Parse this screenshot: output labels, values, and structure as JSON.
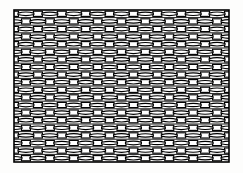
{
  "figure": {
    "title": "Woven wire mesh pattern",
    "caption": "",
    "background_color": "#fdfdfc",
    "ink_color": "#000000",
    "fill_color": "#ffffff",
    "frame": {
      "x": 14,
      "y": 10,
      "width": 215,
      "height": 152,
      "stroke_color": "#000000",
      "stroke_width": 1.6
    },
    "pattern": {
      "type": "woven-mesh",
      "rows": 20,
      "columns": 9,
      "row_height": 7.6,
      "column_width": 23.9,
      "row_offset_alternating": true,
      "strand_shape": "lenticular",
      "strand_stroke_width": 1.15,
      "connector_shape": "rectangle",
      "connector_width": 9,
      "connector_height": 5.2,
      "strand_thickness_max": 4.6,
      "strand_thickness_min": 1.4
    }
  }
}
